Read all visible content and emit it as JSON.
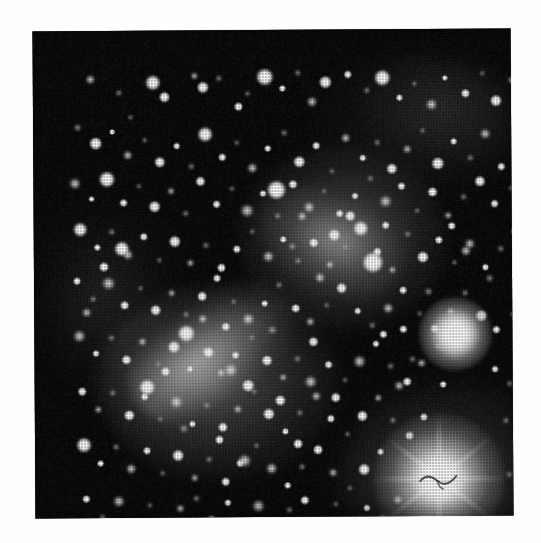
{
  "page": {
    "background_color": "#ffffff",
    "width": 541,
    "height": 543
  },
  "image": {
    "kind": "astronomical-photographic-plate",
    "subject": "dense star cluster field",
    "caption": "",
    "frame": {
      "left": 34,
      "top": 30,
      "width": 478,
      "height": 487,
      "rotation_deg": -0.35,
      "sky_color": "#030303",
      "star_color": "#ffffff"
    },
    "processing": {
      "halftone": true,
      "halftone_pitch_px": 3,
      "grain": true,
      "vignette": true
    }
  },
  "features": {
    "diffuse_glows": [
      {
        "name": "upper-right cluster core",
        "cx": 323,
        "cy": 222,
        "rx": 105,
        "ry": 92,
        "intensity": 0.4
      },
      {
        "name": "central-left cluster core",
        "cx": 198,
        "cy": 365,
        "rx": 120,
        "ry": 97,
        "intensity": 0.38
      },
      {
        "name": "diagonal bright bar",
        "cx": 190,
        "cy": 336,
        "rx": 90,
        "ry": 46,
        "intensity": 0.55,
        "angle_deg": -34
      },
      {
        "name": "inter-core bridge",
        "cx": 310,
        "cy": 225,
        "rx": 75,
        "ry": 40,
        "intensity": 0.3,
        "angle_deg": 26
      },
      {
        "name": "top-right haze",
        "cx": 400,
        "cy": 110,
        "rx": 100,
        "ry": 70,
        "intensity": 0.14
      },
      {
        "name": "bottom-right haze",
        "cx": 430,
        "cy": 457,
        "rx": 110,
        "ry": 88,
        "intensity": 0.3
      },
      {
        "name": "left haze",
        "cx": 85,
        "cy": 280,
        "rx": 75,
        "ry": 100,
        "intensity": 0.1
      }
    ],
    "saturated_stars": [
      {
        "name": "lower-right blaze star",
        "cx": 418,
        "cy": 464,
        "halo_radius": 66,
        "has_defect_mark": true
      },
      {
        "name": "right-edge bright star",
        "cx": 435,
        "cy": 319,
        "halo_radius": 37,
        "has_defect_mark": false
      }
    ],
    "plate_defect": {
      "name": "squiggle scratch",
      "cx": 417,
      "cy": 466,
      "description": "dark hairline squiggle over the saturated stellar core"
    },
    "star_count_rendered": 268
  },
  "stars": [
    [
      57,
      48,
      9,
      "soft"
    ],
    [
      86,
      62,
      6,
      "faint"
    ],
    [
      120,
      52,
      14,
      "blaze"
    ],
    [
      131,
      66,
      11,
      ""
    ],
    [
      97,
      86,
      5,
      "faint"
    ],
    [
      161,
      45,
      7,
      "soft"
    ],
    [
      170,
      57,
      12,
      ""
    ],
    [
      186,
      48,
      6,
      "faint"
    ],
    [
      205,
      76,
      9,
      ""
    ],
    [
      214,
      63,
      5,
      "faint"
    ],
    [
      232,
      47,
      16,
      "blaze"
    ],
    [
      249,
      58,
      7,
      ""
    ],
    [
      265,
      43,
      6,
      "faint"
    ],
    [
      279,
      72,
      10,
      "soft"
    ],
    [
      292,
      52,
      13,
      ""
    ],
    [
      315,
      45,
      8,
      ""
    ],
    [
      334,
      61,
      6,
      "faint"
    ],
    [
      349,
      48,
      15,
      "blaze"
    ],
    [
      366,
      68,
      7,
      ""
    ],
    [
      381,
      54,
      5,
      "faint"
    ],
    [
      398,
      75,
      11,
      "soft"
    ],
    [
      412,
      49,
      6,
      ""
    ],
    [
      432,
      64,
      9,
      ""
    ],
    [
      449,
      44,
      5,
      "faint"
    ],
    [
      463,
      72,
      12,
      ""
    ],
    [
      478,
      51,
      7,
      "soft"
    ],
    [
      492,
      66,
      10,
      ""
    ],
    [
      44,
      96,
      7,
      "faint"
    ],
    [
      62,
      112,
      13,
      ""
    ],
    [
      79,
      101,
      6,
      ""
    ],
    [
      94,
      124,
      9,
      "soft"
    ],
    [
      111,
      109,
      5,
      "faint"
    ],
    [
      126,
      131,
      11,
      ""
    ],
    [
      143,
      115,
      7,
      ""
    ],
    [
      158,
      136,
      6,
      "faint"
    ],
    [
      172,
      104,
      14,
      "blaze"
    ],
    [
      189,
      127,
      8,
      ""
    ],
    [
      203,
      112,
      5,
      "faint"
    ],
    [
      219,
      138,
      10,
      "soft"
    ],
    [
      234,
      118,
      7,
      ""
    ],
    [
      251,
      103,
      6,
      "faint"
    ],
    [
      266,
      132,
      12,
      ""
    ],
    [
      283,
      116,
      8,
      ""
    ],
    [
      298,
      141,
      5,
      "faint"
    ],
    [
      312,
      108,
      9,
      "soft"
    ],
    [
      329,
      128,
      7,
      ""
    ],
    [
      344,
      113,
      6,
      "faint"
    ],
    [
      358,
      139,
      11,
      ""
    ],
    [
      374,
      120,
      8,
      "soft"
    ],
    [
      389,
      101,
      5,
      "faint"
    ],
    [
      404,
      134,
      13,
      ""
    ],
    [
      420,
      112,
      7,
      ""
    ],
    [
      437,
      129,
      6,
      "faint"
    ],
    [
      452,
      105,
      10,
      "soft"
    ],
    [
      468,
      138,
      8,
      ""
    ],
    [
      484,
      117,
      5,
      "faint"
    ],
    [
      497,
      102,
      9,
      ""
    ],
    [
      41,
      152,
      11,
      "soft"
    ],
    [
      58,
      168,
      6,
      ""
    ],
    [
      73,
      148,
      15,
      "blaze"
    ],
    [
      90,
      172,
      8,
      ""
    ],
    [
      105,
      155,
      5,
      "faint"
    ],
    [
      121,
      176,
      12,
      ""
    ],
    [
      137,
      160,
      7,
      "soft"
    ],
    [
      152,
      183,
      6,
      "faint"
    ],
    [
      167,
      151,
      10,
      ""
    ],
    [
      183,
      174,
      8,
      ""
    ],
    [
      198,
      158,
      5,
      "faint"
    ],
    [
      213,
      180,
      13,
      "soft"
    ],
    [
      229,
      163,
      7,
      ""
    ],
    [
      244,
      186,
      6,
      "faint"
    ],
    [
      259,
      154,
      9,
      ""
    ],
    [
      275,
      177,
      11,
      "soft"
    ],
    [
      290,
      161,
      5,
      "faint"
    ],
    [
      306,
      184,
      8,
      ""
    ],
    [
      321,
      166,
      7,
      ""
    ],
    [
      337,
      149,
      6,
      "faint"
    ],
    [
      352,
      172,
      12,
      "soft"
    ],
    [
      368,
      157,
      8,
      ""
    ],
    [
      383,
      181,
      5,
      "faint"
    ],
    [
      399,
      163,
      10,
      ""
    ],
    [
      414,
      186,
      7,
      "soft"
    ],
    [
      430,
      168,
      6,
      "faint"
    ],
    [
      446,
      152,
      11,
      ""
    ],
    [
      461,
      175,
      8,
      ""
    ],
    [
      477,
      159,
      5,
      "faint"
    ],
    [
      492,
      182,
      9,
      "soft"
    ],
    [
      46,
      198,
      13,
      "blaze"
    ],
    [
      63,
      216,
      7,
      ""
    ],
    [
      78,
      201,
      6,
      "faint"
    ],
    [
      94,
      224,
      10,
      "soft"
    ],
    [
      110,
      206,
      8,
      ""
    ],
    [
      125,
      229,
      5,
      "faint"
    ],
    [
      141,
      211,
      12,
      ""
    ],
    [
      156,
      232,
      7,
      "soft"
    ],
    [
      172,
      215,
      6,
      "faint"
    ],
    [
      187,
      237,
      9,
      ""
    ],
    [
      203,
      219,
      8,
      ""
    ],
    [
      218,
      201,
      5,
      "faint"
    ],
    [
      234,
      226,
      11,
      "soft"
    ],
    [
      249,
      209,
      7,
      ""
    ],
    [
      264,
      231,
      6,
      "faint"
    ],
    [
      280,
      213,
      10,
      ""
    ],
    [
      296,
      235,
      8,
      "soft"
    ],
    [
      311,
      217,
      5,
      "faint"
    ],
    [
      327,
      199,
      14,
      "blaze"
    ],
    [
      343,
      222,
      9,
      ""
    ],
    [
      358,
      240,
      7,
      "soft"
    ],
    [
      374,
      205,
      6,
      "faint"
    ],
    [
      389,
      228,
      12,
      ""
    ],
    [
      405,
      211,
      8,
      ""
    ],
    [
      420,
      233,
      5,
      "faint"
    ],
    [
      436,
      215,
      10,
      "soft"
    ],
    [
      451,
      238,
      7,
      ""
    ],
    [
      467,
      220,
      6,
      "faint"
    ],
    [
      482,
      202,
      11,
      ""
    ],
    [
      497,
      225,
      8,
      "soft"
    ],
    [
      43,
      250,
      8,
      ""
    ],
    [
      59,
      268,
      6,
      "faint"
    ],
    [
      74,
      252,
      13,
      "soft"
    ],
    [
      90,
      274,
      9,
      ""
    ],
    [
      106,
      257,
      5,
      "faint"
    ],
    [
      121,
      279,
      11,
      ""
    ],
    [
      137,
      262,
      7,
      "soft"
    ],
    [
      152,
      284,
      6,
      "faint"
    ],
    [
      168,
      266,
      10,
      ""
    ],
    [
      183,
      248,
      8,
      ""
    ],
    [
      199,
      271,
      5,
      "faint"
    ],
    [
      214,
      289,
      12,
      "soft"
    ],
    [
      230,
      273,
      7,
      ""
    ],
    [
      245,
      255,
      6,
      "faint"
    ],
    [
      261,
      278,
      9,
      ""
    ],
    [
      276,
      292,
      8,
      "soft"
    ],
    [
      292,
      275,
      5,
      "faint"
    ],
    [
      307,
      258,
      11,
      ""
    ],
    [
      323,
      281,
      7,
      ""
    ],
    [
      338,
      296,
      6,
      "faint"
    ],
    [
      354,
      279,
      10,
      "soft"
    ],
    [
      369,
      261,
      8,
      ""
    ],
    [
      385,
      284,
      5,
      "faint"
    ],
    [
      400,
      299,
      9,
      ""
    ],
    [
      416,
      282,
      7,
      "soft"
    ],
    [
      431,
      264,
      6,
      "faint"
    ],
    [
      447,
      287,
      12,
      ""
    ],
    [
      462,
      301,
      8,
      ""
    ],
    [
      478,
      285,
      5,
      "faint"
    ],
    [
      493,
      267,
      10,
      "soft"
    ],
    [
      45,
      305,
      12,
      "soft"
    ],
    [
      61,
      322,
      7,
      ""
    ],
    [
      77,
      307,
      6,
      "faint"
    ],
    [
      92,
      329,
      10,
      ""
    ],
    [
      108,
      311,
      8,
      "soft"
    ],
    [
      123,
      333,
      5,
      "faint"
    ],
    [
      139,
      316,
      13,
      ""
    ],
    [
      155,
      338,
      7,
      ""
    ],
    [
      170,
      320,
      6,
      "faint"
    ],
    [
      186,
      342,
      9,
      "soft"
    ],
    [
      201,
      325,
      8,
      ""
    ],
    [
      217,
      307,
      5,
      "faint"
    ],
    [
      232,
      330,
      11,
      ""
    ],
    [
      248,
      347,
      7,
      "soft"
    ],
    [
      263,
      329,
      6,
      "faint"
    ],
    [
      279,
      312,
      10,
      ""
    ],
    [
      294,
      335,
      8,
      ""
    ],
    [
      310,
      350,
      5,
      "faint"
    ],
    [
      325,
      332,
      12,
      "soft"
    ],
    [
      341,
      314,
      7,
      ""
    ],
    [
      356,
      337,
      6,
      "faint"
    ],
    [
      372,
      352,
      9,
      ""
    ],
    [
      387,
      334,
      8,
      "soft"
    ],
    [
      403,
      317,
      5,
      "faint"
    ],
    [
      460,
      340,
      7,
      ""
    ],
    [
      475,
      355,
      6,
      "faint"
    ],
    [
      491,
      337,
      10,
      "soft"
    ],
    [
      47,
      360,
      9,
      ""
    ],
    [
      63,
      378,
      7,
      "soft"
    ],
    [
      78,
      362,
      6,
      "faint"
    ],
    [
      94,
      384,
      11,
      ""
    ],
    [
      110,
      366,
      8,
      ""
    ],
    [
      125,
      388,
      5,
      "faint"
    ],
    [
      141,
      371,
      13,
      "soft"
    ],
    [
      157,
      393,
      7,
      ""
    ],
    [
      172,
      375,
      6,
      "faint"
    ],
    [
      188,
      397,
      10,
      ""
    ],
    [
      203,
      379,
      8,
      "soft"
    ],
    [
      219,
      361,
      5,
      "faint"
    ],
    [
      234,
      384,
      12,
      ""
    ],
    [
      250,
      401,
      7,
      ""
    ],
    [
      265,
      383,
      6,
      "faint"
    ],
    [
      281,
      366,
      9,
      "soft"
    ],
    [
      296,
      389,
      8,
      ""
    ],
    [
      312,
      404,
      5,
      "faint"
    ],
    [
      327,
      386,
      11,
      ""
    ],
    [
      343,
      368,
      7,
      "soft"
    ],
    [
      358,
      391,
      6,
      "faint"
    ],
    [
      374,
      406,
      9,
      ""
    ],
    [
      389,
      388,
      8,
      ""
    ],
    [
      471,
      392,
      6,
      "faint"
    ],
    [
      487,
      374,
      10,
      "soft"
    ],
    [
      49,
      414,
      14,
      "blaze"
    ],
    [
      65,
      432,
      7,
      ""
    ],
    [
      81,
      416,
      6,
      "faint"
    ],
    [
      96,
      438,
      10,
      "soft"
    ],
    [
      112,
      420,
      8,
      ""
    ],
    [
      127,
      442,
      5,
      "faint"
    ],
    [
      143,
      425,
      12,
      ""
    ],
    [
      159,
      447,
      7,
      "soft"
    ],
    [
      174,
      429,
      6,
      "faint"
    ],
    [
      190,
      451,
      9,
      ""
    ],
    [
      205,
      433,
      8,
      ""
    ],
    [
      221,
      415,
      5,
      "faint"
    ],
    [
      236,
      438,
      11,
      "soft"
    ],
    [
      252,
      455,
      7,
      ""
    ],
    [
      267,
      437,
      6,
      "faint"
    ],
    [
      283,
      420,
      10,
      ""
    ],
    [
      298,
      443,
      8,
      "soft"
    ],
    [
      314,
      458,
      5,
      "faint"
    ],
    [
      329,
      440,
      12,
      ""
    ],
    [
      345,
      422,
      7,
      ""
    ],
    [
      490,
      428,
      9,
      "soft"
    ],
    [
      474,
      446,
      6,
      "faint"
    ],
    [
      51,
      468,
      8,
      ""
    ],
    [
      67,
      486,
      6,
      "faint"
    ],
    [
      83,
      470,
      11,
      "soft"
    ],
    [
      98,
      492,
      7,
      ""
    ],
    [
      114,
      474,
      5,
      "faint"
    ],
    [
      130,
      496,
      9,
      ""
    ],
    [
      145,
      478,
      8,
      "soft"
    ],
    [
      161,
      468,
      6,
      "faint"
    ],
    [
      176,
      490,
      10,
      ""
    ],
    [
      192,
      472,
      7,
      ""
    ],
    [
      207,
      494,
      5,
      "faint"
    ],
    [
      223,
      476,
      12,
      "soft"
    ],
    [
      238,
      498,
      7,
      ""
    ],
    [
      254,
      480,
      6,
      "faint"
    ],
    [
      269,
      470,
      9,
      ""
    ],
    [
      285,
      492,
      8,
      "soft"
    ],
    [
      300,
      474,
      5,
      "faint"
    ],
    [
      316,
      496,
      10,
      ""
    ],
    [
      331,
      478,
      7,
      ""
    ],
    [
      347,
      488,
      6,
      "faint"
    ],
    [
      362,
      470,
      9,
      "soft"
    ],
    [
      483,
      484,
      7,
      ""
    ],
    [
      496,
      468,
      5,
      "faint"
    ],
    [
      243,
      160,
      18,
      "blaze"
    ],
    [
      300,
      205,
      13,
      ""
    ],
    [
      268,
      186,
      9,
      "soft"
    ],
    [
      339,
      233,
      20,
      "blaze"
    ],
    [
      316,
      186,
      11,
      ""
    ],
    [
      286,
      248,
      10,
      "soft"
    ],
    [
      352,
      196,
      8,
      ""
    ],
    [
      258,
      216,
      7,
      "faint"
    ],
    [
      152,
      303,
      16,
      "blaze"
    ],
    [
      174,
      322,
      12,
      ""
    ],
    [
      196,
      340,
      14,
      "soft"
    ],
    [
      131,
      341,
      10,
      ""
    ],
    [
      213,
      355,
      13,
      ""
    ],
    [
      168,
      288,
      9,
      "soft"
    ],
    [
      112,
      356,
      15,
      "blaze"
    ],
    [
      245,
      370,
      11,
      ""
    ],
    [
      238,
      300,
      8,
      "faint"
    ],
    [
      191,
      296,
      9,
      ""
    ],
    [
      276,
      352,
      12,
      "soft"
    ],
    [
      301,
      368,
      10,
      ""
    ],
    [
      432,
      222,
      10,
      "soft"
    ],
    [
      418,
      197,
      8,
      ""
    ],
    [
      455,
      249,
      7,
      "faint"
    ],
    [
      88,
      218,
      14,
      "blaze"
    ],
    [
      70,
      236,
      10,
      ""
    ],
    [
      52,
      281,
      9,
      "soft"
    ],
    [
      369,
      300,
      8,
      ""
    ],
    [
      394,
      262,
      7,
      "faint"
    ],
    [
      209,
      430,
      13,
      "soft"
    ],
    [
      263,
      414,
      10,
      ""
    ],
    [
      184,
      409,
      9,
      ""
    ],
    [
      149,
      398,
      8,
      "faint"
    ],
    [
      364,
      356,
      9,
      "soft"
    ],
    [
      349,
      305,
      8,
      ""
    ],
    [
      378,
      330,
      6,
      "faint"
    ],
    [
      408,
      355,
      7,
      ""
    ]
  ]
}
